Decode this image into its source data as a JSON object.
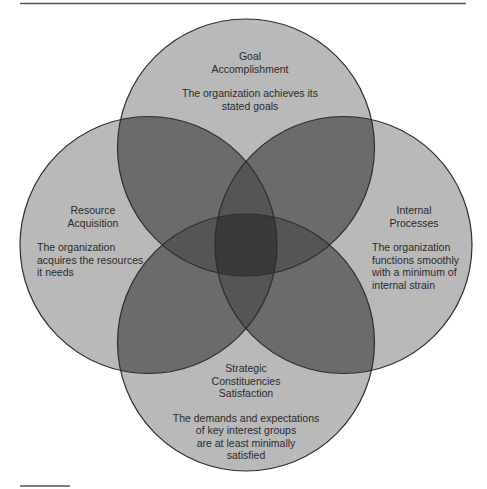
{
  "diagram": {
    "type": "four-circle venn",
    "colors": {
      "background": "#ffffff",
      "single_fill": "#b9b9b9",
      "double_overlap": "#6b6b6b",
      "triple_overlap": "#4a4a4a",
      "center_overlap": "#3a3a3a",
      "stroke": "#333333",
      "text": "#2a2a2a"
    },
    "circles": [
      {
        "id": "goal",
        "position": "top",
        "title_lines": [
          "Goal",
          "Accomplishment"
        ],
        "description_lines": [
          "The organization achieves its",
          "stated goals"
        ]
      },
      {
        "id": "resource",
        "position": "left",
        "title_lines": [
          "Resource",
          "Acquisition"
        ],
        "description_lines": [
          "The organization",
          "acquires the resources",
          "it needs"
        ]
      },
      {
        "id": "internal",
        "position": "right",
        "title_lines": [
          "Internal",
          "Processes"
        ],
        "description_lines": [
          "The organization",
          "functions smoothly",
          "with a minimum of",
          "internal strain"
        ]
      },
      {
        "id": "strategic",
        "position": "bottom",
        "title_lines": [
          "Strategic",
          "Constituencies",
          "Satisfaction"
        ],
        "description_lines": [
          "The demands and expectations",
          "of key interest groups",
          "are at least minimally",
          "satisfied"
        ]
      }
    ]
  }
}
